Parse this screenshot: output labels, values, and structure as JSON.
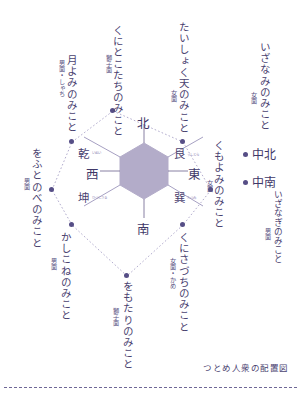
{
  "figure": {
    "caption": "つとめ人衆の配置図",
    "center_shape": "hexagon",
    "accent_color": "#564e86",
    "line_color": "#9a93bd",
    "hex_fill": "#b3acc9"
  },
  "directions": {
    "north": "北",
    "south": "南",
    "east": "東",
    "west": "西",
    "northwest": "乾",
    "northwest_ruby": "いぬい",
    "northeast": "艮",
    "northeast_ruby": "うしとら",
    "southwest": "坤",
    "southwest_ruby": "ひつじさる",
    "southeast": "巽",
    "southeast_ruby": "たつみ"
  },
  "performers": [
    {
      "id": "kunitokotachi",
      "name": "くにとこたちのみこと",
      "face": "獅子面",
      "position": "北"
    },
    {
      "id": "taishokuten",
      "name": "たいしょく天のみこと",
      "face": "女面",
      "position": "艮"
    },
    {
      "id": "tsukiyomi",
      "name": "月よみのみこと",
      "face": "男面・しゃち",
      "position": "乾"
    },
    {
      "id": "ofutonobe",
      "name": "をふとのべのみこと",
      "face": "男面",
      "position": "西"
    },
    {
      "id": "kashikone",
      "name": "かしこねのみこと",
      "face": "男面",
      "position": "坤"
    },
    {
      "id": "omotari",
      "name": "をもたりのみこと",
      "face": "獅子面",
      "position": "南"
    },
    {
      "id": "kunisazuchi",
      "name": "くにさづちのみこと",
      "face": "女面・かめ",
      "position": "巽"
    },
    {
      "id": "kumoyomi",
      "name": "くもよみのみこと",
      "face": "女面",
      "position": "東"
    }
  ],
  "center_performers": [
    {
      "id": "izanami",
      "name": "いざなみのみこと",
      "face": "女面",
      "marker": "中北"
    },
    {
      "id": "izanagi",
      "name": "いざなぎのみこと",
      "face": "男面",
      "marker": "中南"
    }
  ]
}
